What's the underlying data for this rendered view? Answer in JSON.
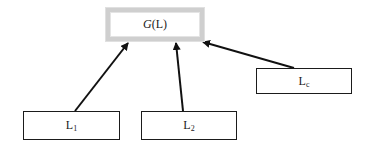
{
  "diagram": {
    "type": "hierarchy",
    "root": {
      "id": "G",
      "label_func": "G",
      "label_arg": "(L)",
      "x": 106,
      "y": 8,
      "w": 98,
      "h": 33,
      "border_color": "#cfcfcf"
    },
    "leaves": [
      {
        "id": "L1",
        "base": "L",
        "sub": "1",
        "x": 23,
        "y": 111,
        "w": 97,
        "h": 29
      },
      {
        "id": "L2",
        "base": "L",
        "sub": "2",
        "x": 141,
        "y": 111,
        "w": 96,
        "h": 29
      },
      {
        "id": "Lc",
        "base": "L",
        "sub": "c",
        "x": 256,
        "y": 68,
        "w": 96,
        "h": 26
      }
    ],
    "edges": [
      {
        "from": "L1",
        "to": "G",
        "x1": 75,
        "y1": 111,
        "x2": 128,
        "y2": 43
      },
      {
        "from": "L2",
        "to": "G",
        "x1": 183,
        "y1": 111,
        "x2": 176,
        "y2": 43
      },
      {
        "from": "Lc",
        "to": "G",
        "x1": 294,
        "y1": 68,
        "x2": 203,
        "y2": 42
      }
    ],
    "edge_color": "#111111"
  }
}
